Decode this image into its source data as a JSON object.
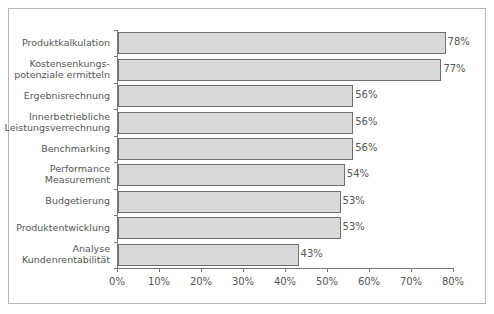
{
  "chart_data": {
    "type": "bar",
    "orientation": "horizontal",
    "title": "",
    "xlabel": "",
    "ylabel": "",
    "categories": [
      "Produktkalkulation",
      "Kostensenkungs-\npotenziale ermitteln",
      "Ergebnisrechnung",
      "Innerbetriebliche\nLeistungsverrechnung",
      "Benchmarking",
      "Performance\nMeasurement",
      "Budgetierung",
      "Produktentwicklung",
      "Analyse\nKundenrentabilität"
    ],
    "values": [
      78,
      77,
      56,
      56,
      56,
      54,
      53,
      53,
      43
    ],
    "value_labels": [
      "78%",
      "77%",
      "56%",
      "56%",
      "56%",
      "54%",
      "53%",
      "53%",
      "43%"
    ],
    "xlim": [
      0,
      80
    ],
    "xticks": [
      "0%",
      "10%",
      "20%",
      "30%",
      "40%",
      "50%",
      "60%",
      "70%",
      "80%"
    ],
    "grid": false,
    "legend": null,
    "bar_color": "#d9d9d9",
    "bar_edge_color": "#6f6f6f"
  }
}
